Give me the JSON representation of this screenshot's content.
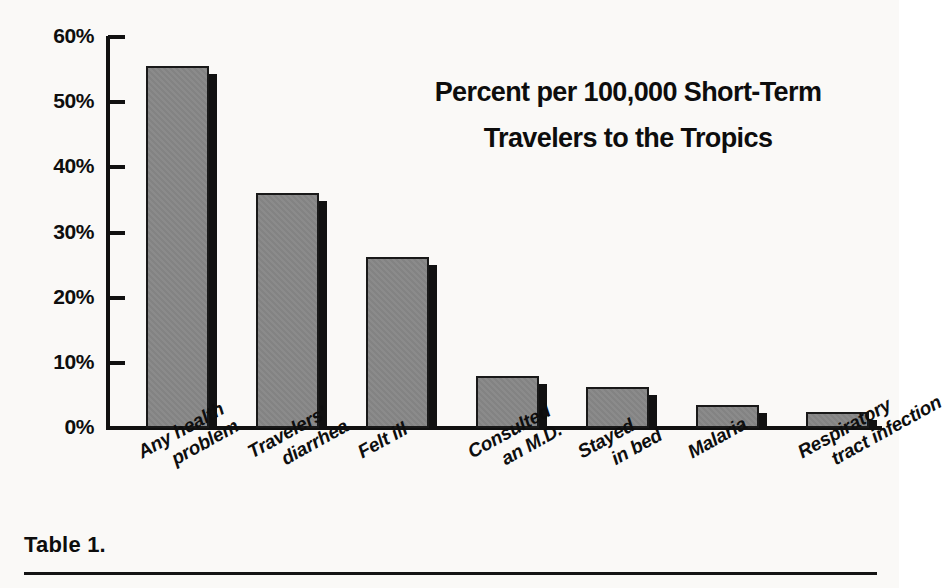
{
  "figure": {
    "caption": "Table 1.",
    "background_color": "#faf9f7",
    "bar_color": "#838383",
    "shadow_color": "#111111",
    "axis_color": "#111111"
  },
  "chart_data": {
    "type": "bar",
    "title": "Percent per 100,000 Short-Term Travelers to the Tropics",
    "title_lines": [
      "Percent per 100,000 Short-Term",
      "Travelers to the Tropics"
    ],
    "xlabel": "",
    "ylabel": "",
    "ylim": [
      0,
      60
    ],
    "grid": false,
    "legend": false,
    "ytick_labels": [
      "60%",
      "50%",
      "40%",
      "30%",
      "20%",
      "10%",
      "0%"
    ],
    "ytick_values": [
      60,
      50,
      40,
      30,
      20,
      10,
      0
    ],
    "categories": [
      "Any health problem",
      "Travelers' diarrhea",
      "Felt ill",
      "Consulted an M.D.",
      "Stayed in bed",
      "Malaria",
      "Respiratory tract infection"
    ],
    "category_lines": [
      [
        "Any health",
        "problem"
      ],
      [
        "Travelers'",
        "diarrhea"
      ],
      [
        "Felt ill"
      ],
      [
        "Consulted",
        "an M.D."
      ],
      [
        "Stayed",
        "in bed"
      ],
      [
        "Malaria"
      ],
      [
        "Respiratory",
        "tract infection"
      ]
    ],
    "values": [
      55.5,
      36.0,
      26.3,
      8.0,
      6.3,
      3.6,
      2.5
    ]
  }
}
